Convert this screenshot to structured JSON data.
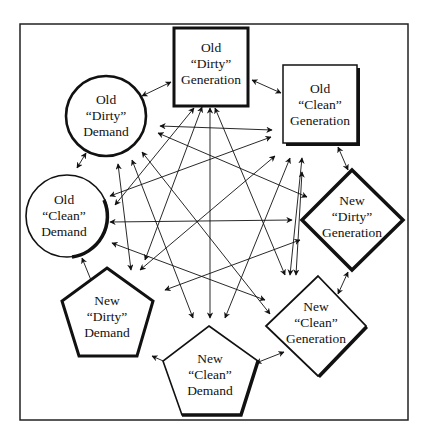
{
  "diagram": {
    "type": "fully-connected network",
    "nodes": [
      {
        "id": "old_dirty_gen",
        "shape": "square",
        "lines": [
          "Old",
          "“Dirty”",
          "Generation"
        ]
      },
      {
        "id": "old_clean_gen",
        "shape": "square-shadow",
        "lines": [
          "Old",
          "“Clean”",
          "Generation"
        ]
      },
      {
        "id": "new_dirty_gen",
        "shape": "diamond",
        "lines": [
          "New",
          "“Dirty”",
          "Generation"
        ]
      },
      {
        "id": "new_clean_gen",
        "shape": "diamond",
        "lines": [
          "New",
          "“Clean”",
          "Generation"
        ]
      },
      {
        "id": "new_clean_dem",
        "shape": "pentagon",
        "lines": [
          "New",
          "“Clean”",
          "Demand"
        ]
      },
      {
        "id": "new_dirty_dem",
        "shape": "pentagon",
        "lines": [
          "New",
          "“Dirty”",
          "Demand"
        ]
      },
      {
        "id": "old_clean_dem",
        "shape": "circle",
        "lines": [
          "Old",
          "“Clean”",
          "Demand"
        ]
      },
      {
        "id": "old_dirty_dem",
        "shape": "circle",
        "lines": [
          "Old",
          "“Dirty”",
          "Demand"
        ]
      }
    ],
    "edges": "bidirectional arrows between every pair of nodes",
    "colors": {
      "stroke": "#111111",
      "background": "#ffffff"
    }
  }
}
